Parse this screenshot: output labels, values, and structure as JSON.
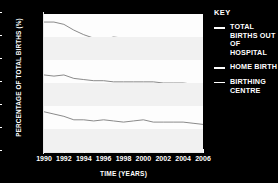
{
  "chart_data": {
    "type": "line",
    "title": "",
    "xlabel": "TIME (YEARS)",
    "ylabel": "PERCENTAGE OF TOTAL BIRTHS (%)",
    "xlim": [
      1990,
      2006
    ],
    "ylim": [
      0,
      1.2
    ],
    "xticks": [
      "1990",
      "1992",
      "1994",
      "1996",
      "1998",
      "2000",
      "2002",
      "2004",
      "2006"
    ],
    "xtick_values": [
      1990,
      1992,
      1994,
      1996,
      1998,
      2000,
      2002,
      2004,
      2006
    ],
    "yticks": [
      "0",
      "0.2",
      "0.4",
      "0.6",
      "0.8",
      "1.0",
      "1.2"
    ],
    "ytick_values": [
      0,
      0.2,
      0.4,
      0.6,
      0.8,
      1.0,
      1.2
    ],
    "grid": false,
    "legend_position": "right",
    "x": [
      1990,
      1991,
      1992,
      1993,
      1994,
      1995,
      1996,
      1997,
      1998,
      1999,
      2000,
      2001,
      2002,
      2003,
      2004,
      2005,
      2006
    ],
    "series": [
      {
        "name": "TOTAL BIRTHS OUT OF HOSPITAL",
        "color": "#8a8a8a",
        "values": [
          1.13,
          1.13,
          1.11,
          1.06,
          1.02,
          0.99,
          0.98,
          1.0,
          0.99,
          0.96,
          0.95,
          0.94,
          0.93,
          0.93,
          0.92,
          0.9,
          0.88
        ]
      },
      {
        "name": "HOME BIRTH",
        "color": "#8a8a8a",
        "values": [
          0.67,
          0.66,
          0.67,
          0.64,
          0.63,
          0.62,
          0.62,
          0.61,
          0.61,
          0.61,
          0.61,
          0.61,
          0.6,
          0.6,
          0.6,
          0.59,
          0.57
        ]
      },
      {
        "name": "BIRTHING CENTRE",
        "color": "#8a8a8a",
        "values": [
          0.35,
          0.33,
          0.31,
          0.28,
          0.28,
          0.27,
          0.28,
          0.27,
          0.26,
          0.27,
          0.28,
          0.26,
          0.26,
          0.26,
          0.26,
          0.25,
          0.24
        ]
      }
    ]
  },
  "legend": {
    "title": "KEY",
    "entries": [
      {
        "label": "TOTAL BIRTHS OUT OF HOSPITAL"
      },
      {
        "label": "HOME BIRTH"
      },
      {
        "label": "BIRTHING CENTRE"
      }
    ]
  }
}
